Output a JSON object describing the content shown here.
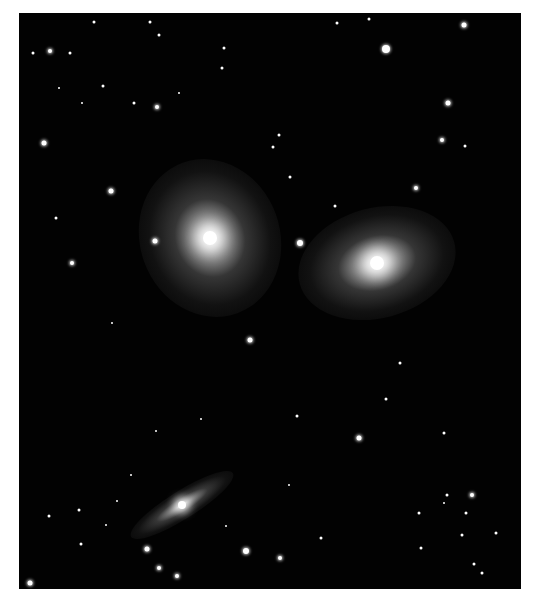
{
  "image": {
    "subject": "interacting galaxy group",
    "background": "#020202",
    "frame": {
      "left": 19,
      "top": 13,
      "width": 502,
      "height": 576
    }
  },
  "galaxies": [
    {
      "name": "left-spiral-galaxy",
      "cx": 191,
      "cy": 225,
      "rx": 70,
      "ry": 80,
      "rot": -20,
      "core": 14
    },
    {
      "name": "right-spiral-galaxy",
      "cx": 358,
      "cy": 250,
      "rx": 80,
      "ry": 55,
      "rot": -15,
      "core": 14
    },
    {
      "name": "edge-on-galaxy",
      "cx": 163,
      "cy": 492,
      "rx": 60,
      "ry": 14,
      "rot": -32,
      "core": 8
    }
  ],
  "stars": [
    [
      31,
      38,
      4
    ],
    [
      131,
      9,
      3
    ],
    [
      140,
      22,
      3
    ],
    [
      205,
      35,
      3
    ],
    [
      25,
      130,
      5
    ],
    [
      51,
      40,
      3
    ],
    [
      367,
      36,
      8
    ],
    [
      445,
      12,
      5
    ],
    [
      429,
      90,
      5
    ],
    [
      423,
      127,
      4
    ],
    [
      397,
      175,
      4
    ],
    [
      446,
      133,
      3
    ],
    [
      92,
      178,
      5
    ],
    [
      138,
      94,
      4
    ],
    [
      115,
      90,
      3
    ],
    [
      37,
      205,
      3
    ],
    [
      53,
      250,
      4
    ],
    [
      136,
      228,
      5
    ],
    [
      281,
      230,
      6
    ],
    [
      231,
      327,
      5
    ],
    [
      271,
      164,
      3
    ],
    [
      316,
      193,
      3
    ],
    [
      260,
      122,
      3
    ],
    [
      254,
      134,
      3
    ],
    [
      318,
      10,
      3
    ],
    [
      350,
      6,
      3
    ],
    [
      84,
      73,
      3
    ],
    [
      75,
      9,
      3
    ],
    [
      14,
      40,
      3
    ],
    [
      40,
      75,
      2
    ],
    [
      63,
      90,
      2
    ],
    [
      160,
      80,
      2
    ],
    [
      203,
      55,
      3
    ],
    [
      278,
      403,
      3
    ],
    [
      381,
      350,
      3
    ],
    [
      367,
      386,
      3
    ],
    [
      402,
      535,
      3
    ],
    [
      455,
      551,
      3
    ],
    [
      340,
      425,
      5
    ],
    [
      425,
      420,
      3
    ],
    [
      428,
      482,
      3
    ],
    [
      453,
      482,
      4
    ],
    [
      425,
      490,
      2
    ],
    [
      447,
      500,
      3
    ],
    [
      443,
      522,
      3
    ],
    [
      400,
      500,
      3
    ],
    [
      463,
      560,
      3
    ],
    [
      62,
      531,
      3
    ],
    [
      128,
      536,
      5
    ],
    [
      227,
      538,
      6
    ],
    [
      261,
      545,
      4
    ],
    [
      158,
      563,
      4
    ],
    [
      140,
      555,
      4
    ],
    [
      11,
      570,
      5
    ],
    [
      87,
      512,
      2
    ],
    [
      98,
      488,
      2
    ],
    [
      207,
      513,
      2
    ],
    [
      302,
      525,
      3
    ],
    [
      270,
      472,
      2
    ],
    [
      477,
      520,
      3
    ],
    [
      30,
      503,
      3
    ],
    [
      60,
      497,
      3
    ],
    [
      112,
      462,
      2
    ],
    [
      137,
      418,
      2
    ],
    [
      182,
      406,
      2
    ],
    [
      93,
      310,
      2
    ]
  ]
}
